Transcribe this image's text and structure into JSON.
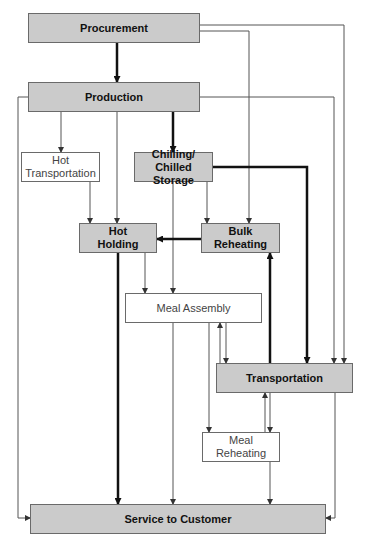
{
  "diagram": {
    "type": "flowchart",
    "colors": {
      "shaded_fill": "#cbcbcb",
      "line": "#555555",
      "thick_line": "#111111"
    },
    "nodes": {
      "procurement": {
        "label": "Procurement",
        "style": "shaded"
      },
      "production": {
        "label": "Production",
        "style": "shaded"
      },
      "hot_transportation": {
        "label": "Hot\nTransportation",
        "style": "plain"
      },
      "chilling": {
        "label": "Chilling/\nChilled Storage",
        "style": "shaded"
      },
      "hot_holding": {
        "label": "Hot\nHolding",
        "style": "shaded"
      },
      "bulk_reheating": {
        "label": "Bulk\nReheating",
        "style": "shaded"
      },
      "meal_assembly": {
        "label": "Meal Assembly",
        "style": "plain"
      },
      "transportation": {
        "label": "Transportation",
        "style": "shaded"
      },
      "meal_reheating": {
        "label": "Meal\nReheating",
        "style": "plain"
      },
      "service": {
        "label": "Service to Customer",
        "style": "shaded"
      }
    },
    "edges": [
      {
        "from": "Procurement",
        "to": "Production",
        "weight": "thick"
      },
      {
        "from": "Procurement",
        "to": "Bulk Reheating",
        "weight": "thin"
      },
      {
        "from": "Procurement",
        "to": "Transportation",
        "weight": "thin"
      },
      {
        "from": "Production",
        "to": "Hot Transportation",
        "weight": "thin"
      },
      {
        "from": "Production",
        "to": "Hot Holding",
        "weight": "thin"
      },
      {
        "from": "Production",
        "to": "Chilling/Chilled Storage",
        "weight": "thick"
      },
      {
        "from": "Production",
        "to": "Transportation",
        "weight": "thin"
      },
      {
        "from": "Production",
        "to": "Service to Customer",
        "weight": "thin"
      },
      {
        "from": "Hot Transportation",
        "to": "Hot Holding",
        "weight": "thin"
      },
      {
        "from": "Chilling/Chilled Storage",
        "to": "Bulk Reheating",
        "weight": "thin"
      },
      {
        "from": "Chilling/Chilled Storage",
        "to": "Meal Assembly",
        "weight": "thin"
      },
      {
        "from": "Chilling/Chilled Storage",
        "to": "Transportation",
        "weight": "thick"
      },
      {
        "from": "Bulk Reheating",
        "to": "Hot Holding",
        "weight": "thick"
      },
      {
        "from": "Hot Holding",
        "to": "Meal Assembly",
        "weight": "thin"
      },
      {
        "from": "Hot Holding",
        "to": "Service to Customer",
        "weight": "thick"
      },
      {
        "from": "Meal Assembly",
        "to": "Transportation",
        "weight": "thin",
        "bidirectional": true
      },
      {
        "from": "Meal Assembly",
        "to": "Meal Reheating",
        "weight": "thin"
      },
      {
        "from": "Meal Assembly",
        "to": "Service to Customer",
        "weight": "thin"
      },
      {
        "from": "Transportation",
        "to": "Bulk Reheating",
        "weight": "thick"
      },
      {
        "from": "Transportation",
        "to": "Meal Reheating",
        "weight": "thin",
        "bidirectional": true
      },
      {
        "from": "Transportation",
        "to": "Service to Customer",
        "weight": "thin"
      },
      {
        "from": "Meal Reheating",
        "to": "Service to Customer",
        "weight": "thin"
      }
    ]
  }
}
